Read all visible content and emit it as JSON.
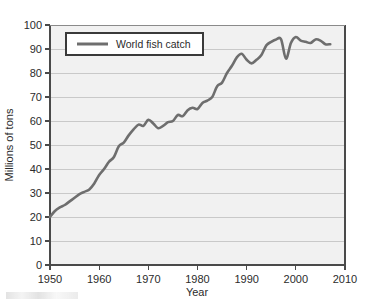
{
  "chart_data": {
    "type": "line",
    "title": "",
    "xlabel": "Year",
    "ylabel": "Millions of tons",
    "xlim": [
      1950,
      2010
    ],
    "ylim": [
      0,
      100
    ],
    "grid": true,
    "grid_axis": "y",
    "legend_position": "top-left-inside",
    "legend_entries": [
      "World fish catch"
    ],
    "line_color": "#6e6e6e",
    "plot_background": "#f1f1f1",
    "xticks": [
      1950,
      1960,
      1970,
      1980,
      1990,
      2000,
      2010
    ],
    "xtick_labels": [
      "1950",
      "1960",
      "1970",
      "1980",
      "1990",
      "2000",
      "2010"
    ],
    "yticks": [
      0,
      10,
      20,
      30,
      40,
      50,
      60,
      70,
      80,
      90,
      100
    ],
    "ytick_labels": [
      "0",
      "10",
      "20",
      "30",
      "40",
      "50",
      "60",
      "70",
      "80",
      "90",
      "100"
    ],
    "series": [
      {
        "name": "World fish catch",
        "x": [
          1950,
          1951,
          1952,
          1953,
          1954,
          1955,
          1956,
          1957,
          1958,
          1959,
          1960,
          1961,
          1962,
          1963,
          1964,
          1965,
          1966,
          1967,
          1968,
          1969,
          1970,
          1971,
          1972,
          1973,
          1974,
          1975,
          1976,
          1977,
          1978,
          1979,
          1980,
          1981,
          1982,
          1983,
          1984,
          1985,
          1986,
          1987,
          1988,
          1989,
          1990,
          1991,
          1992,
          1993,
          1994,
          1995,
          1996,
          1997,
          1998,
          1999,
          2000,
          2001,
          2002,
          2003,
          2004,
          2005,
          2006,
          2007
        ],
        "values": [
          20.0,
          22.5,
          24.0,
          25.0,
          26.5,
          28.0,
          29.5,
          30.5,
          31.5,
          34.0,
          37.5,
          40.0,
          43.0,
          45.0,
          49.5,
          51.0,
          54.0,
          56.5,
          58.5,
          58.0,
          60.5,
          59.0,
          57.0,
          58.0,
          59.5,
          60.0,
          62.5,
          62.0,
          64.5,
          65.5,
          65.0,
          67.5,
          68.5,
          70.0,
          74.5,
          76.0,
          80.0,
          83.0,
          86.5,
          88.0,
          85.5,
          84.0,
          85.5,
          87.5,
          91.5,
          93.0,
          94.0,
          94.0,
          86.0,
          92.5,
          95.0,
          93.5,
          93.0,
          92.5,
          94.0,
          93.5,
          92.0,
          92.0
        ]
      }
    ]
  },
  "legend": {
    "label": "World fish catch"
  },
  "axes": {
    "x_title": "Year",
    "y_title": "Millions of tons"
  }
}
